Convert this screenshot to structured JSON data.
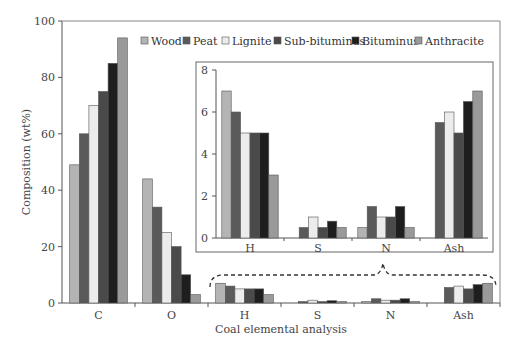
{
  "chart_data": [
    {
      "type": "bar",
      "title": "",
      "xlabel": "Coal elemental analysis",
      "ylabel": "Composition (wt%)",
      "ylim": [
        0,
        100
      ],
      "yticks": [
        0,
        20,
        40,
        60,
        80,
        100
      ],
      "grid": false,
      "legend_position": "top-right",
      "categories": [
        "C",
        "O",
        "H",
        "S",
        "N",
        "Ash"
      ],
      "series": [
        {
          "name": "Wood",
          "color": "#b4b4b4",
          "values": [
            49,
            44,
            7,
            0,
            0.5,
            0
          ]
        },
        {
          "name": "Peat",
          "color": "#5a5a5a",
          "values": [
            60,
            34,
            6,
            0.5,
            1.5,
            5.5
          ]
        },
        {
          "name": "Lignite",
          "color": "#ececec",
          "values": [
            70,
            25,
            5,
            1,
            1,
            6
          ]
        },
        {
          "name": "Sub-bituminus",
          "color": "#4a4a4a",
          "values": [
            75,
            20,
            5,
            0.5,
            1,
            5
          ]
        },
        {
          "name": "Bituminus",
          "color": "#1e1e1e",
          "values": [
            85,
            10,
            5,
            0.8,
            1.5,
            6.5
          ]
        },
        {
          "name": "Anthracite",
          "color": "#9a9a9a",
          "values": [
            94,
            3,
            3,
            0.5,
            0.5,
            7
          ]
        }
      ]
    },
    {
      "type": "bar",
      "title": "Inset (zoom of H, S, N, Ash)",
      "xlabel": "",
      "ylabel": "",
      "ylim": [
        0,
        8
      ],
      "yticks": [
        0,
        2,
        4,
        6,
        8
      ],
      "grid": false,
      "categories": [
        "H",
        "S",
        "N",
        "Ash"
      ],
      "series": [
        {
          "name": "Wood",
          "values": [
            7,
            0,
            0.5,
            0
          ]
        },
        {
          "name": "Peat",
          "values": [
            6,
            0.5,
            1.5,
            5.5
          ]
        },
        {
          "name": "Lignite",
          "values": [
            5,
            1,
            1,
            6
          ]
        },
        {
          "name": "Sub-bituminus",
          "values": [
            5,
            0.5,
            1,
            5
          ]
        },
        {
          "name": "Bituminus",
          "values": [
            5,
            0.8,
            1.5,
            6.5
          ]
        },
        {
          "name": "Anthracite",
          "values": [
            3,
            0.5,
            0.5,
            7
          ]
        }
      ]
    }
  ]
}
